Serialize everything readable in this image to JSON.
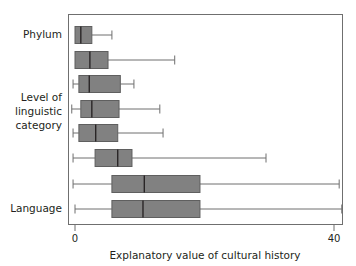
{
  "chart_data": {
    "type": "box",
    "orientation": "horizontal",
    "title": "",
    "xlabel": "Explanatory value of cultural history",
    "ylabel": "",
    "xlim": [
      -2.0,
      42.5
    ],
    "ylim": [
      0,
      8
    ],
    "grid": false,
    "legend": null,
    "xticks": [
      0,
      40
    ],
    "xticklabels": [
      "0",
      "40"
    ],
    "category_axis_labels": [
      {
        "text": "Phylum",
        "row": 1
      },
      {
        "text": "Level of",
        "row": 4.55
      },
      {
        "text": "linguistic",
        "row": 4.0
      },
      {
        "text": "category",
        "row": 3.45
      },
      {
        "text": "Language",
        "row": 8
      }
    ],
    "box_fill": "#818181",
    "box_edge": "#5f5f5f",
    "median_color": "#231f20",
    "whisker_color": "#6e6e6e",
    "axis_color": "#6f6f6f",
    "boxes": [
      {
        "row": 1,
        "name": "box-row-1-phylum",
        "whisker_low": 0.0,
        "q1": 0.0,
        "median": 0.9,
        "q3": 2.6,
        "whisker_high": 5.7,
        "has_low_cap": false
      },
      {
        "row": 2,
        "name": "box-row-2",
        "whisker_low": 0.0,
        "q1": 0.0,
        "median": 2.3,
        "q3": 5.1,
        "whisker_high": 15.4,
        "has_low_cap": false
      },
      {
        "row": 3,
        "name": "box-row-3",
        "whisker_low": -0.3,
        "q1": 0.6,
        "median": 2.2,
        "q3": 7.0,
        "whisker_high": 9.1,
        "has_low_cap": true
      },
      {
        "row": 4,
        "name": "box-row-4",
        "whisker_low": -0.5,
        "q1": 0.9,
        "median": 2.6,
        "q3": 6.8,
        "whisker_high": 13.1,
        "has_low_cap": true
      },
      {
        "row": 5,
        "name": "box-row-5",
        "whisker_low": -0.3,
        "q1": 0.6,
        "median": 3.2,
        "q3": 6.6,
        "whisker_high": 13.6,
        "has_low_cap": true
      },
      {
        "row": 6,
        "name": "box-row-6",
        "whisker_low": -0.3,
        "q1": 3.1,
        "median": 6.6,
        "q3": 8.8,
        "whisker_high": 29.5,
        "has_low_cap": true
      },
      {
        "row": 7,
        "name": "box-row-7",
        "whisker_low": -0.3,
        "q1": 5.7,
        "median": 10.7,
        "q3": 19.3,
        "whisker_high": 40.8,
        "has_low_cap": true
      },
      {
        "row": 8,
        "name": "box-row-8-language",
        "whisker_low": 0.0,
        "q1": 5.7,
        "median": 10.5,
        "q3": 19.3,
        "whisker_high": 41.2,
        "has_low_cap": true
      }
    ]
  },
  "axis": {
    "xlabel": "Explanatory value of cultural history",
    "tick_0": "0",
    "tick_40": "40"
  },
  "categories": {
    "phylum": "Phylum",
    "level_line1": "Level of",
    "level_line2": "linguistic",
    "level_line3": "category",
    "language": "Language"
  }
}
